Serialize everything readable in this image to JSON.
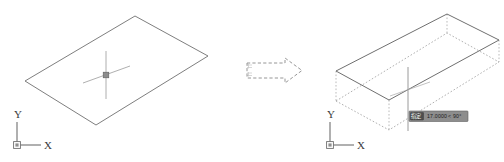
{
  "scene": {
    "background_color": "#ffffff",
    "line_color": "#6b6b6b",
    "dash_color": "#8d8d8d",
    "caption": ""
  },
  "left_view": {
    "name": "before-copy-view",
    "shape_label": "rectangle-plan",
    "ucs": {
      "x_axis_label": "X",
      "y_axis_label": "Y",
      "origin_marker": "ucs-origin-box"
    },
    "cursor": {
      "type": "crosshair-pickbox",
      "pickbox_label": "pick-box"
    }
  },
  "arrow": {
    "name": "transform-arrow",
    "direction": "right",
    "style": "dashed-outline",
    "label": ""
  },
  "right_view": {
    "name": "after-copy-view",
    "source_shape_label": "original-rectangle",
    "copy_shape_label": "copied-rectangle-dashed",
    "ucs": {
      "x_axis_label": "X",
      "y_axis_label": "Y",
      "origin_marker": "ucs-origin-box"
    },
    "rubber_band": {
      "label": "rubber-band-line",
      "orientation": "vertical"
    },
    "dynamic_input": {
      "field_label": "指定",
      "distance_value": "17.0000",
      "separator": "<",
      "angle_value": "90°",
      "background_color": "#8a8a8a",
      "field_background_color": "#4a4a4a"
    }
  }
}
